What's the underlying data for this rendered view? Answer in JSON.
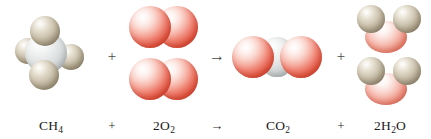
{
  "figure": {
    "name": "combustion-of-methane-equation",
    "background_color": "#ffffff",
    "equation_text": "CH4 + 2O2 -> CO2 + 2H2O"
  },
  "colors": {
    "oxygen": "#e04a3a",
    "oxygen_highlight": "#ffffff",
    "oxygen_water": "#e8806c",
    "carbon": "#d2d6d6",
    "hydrogen": "#a1957d",
    "text": "#1b1b1b",
    "operator": "#4a4a4a"
  },
  "molecules": [
    {
      "id": "methane",
      "formula_label": "CH",
      "subscript": "4",
      "coefficient": "",
      "role": "reactant",
      "atoms": [
        "carbon",
        "hydrogen",
        "hydrogen",
        "hydrogen",
        "hydrogen"
      ],
      "copies": 1
    },
    {
      "id": "dioxygen",
      "formula_label": "O",
      "subscript": "2",
      "coefficient": "2",
      "role": "reactant",
      "atoms": [
        "oxygen",
        "oxygen"
      ],
      "copies": 2
    },
    {
      "id": "carbon-dioxide",
      "formula_label": "CO",
      "subscript": "2",
      "coefficient": "",
      "role": "product",
      "atoms": [
        "oxygen",
        "carbon",
        "oxygen"
      ],
      "copies": 1
    },
    {
      "id": "water",
      "formula_label": "H",
      "subscript": "2",
      "subscript_tail": "O",
      "coefficient": "2",
      "role": "product",
      "atoms": [
        "hydrogen",
        "hydrogen",
        "oxygen"
      ],
      "copies": 2
    }
  ],
  "operators": {
    "plus": "+",
    "arrow": "→"
  },
  "labels": {
    "methane": {
      "prefix": "CH",
      "sub": "4"
    },
    "dioxygen": {
      "prefix": "2O",
      "sub": "2"
    },
    "carbon_dioxide": {
      "prefix": "CO",
      "sub": "2"
    },
    "water": {
      "prefix": "2H",
      "sub": "2",
      "suffix": "O"
    },
    "plus_1": "+",
    "arrow": "→",
    "plus_2": "+"
  }
}
